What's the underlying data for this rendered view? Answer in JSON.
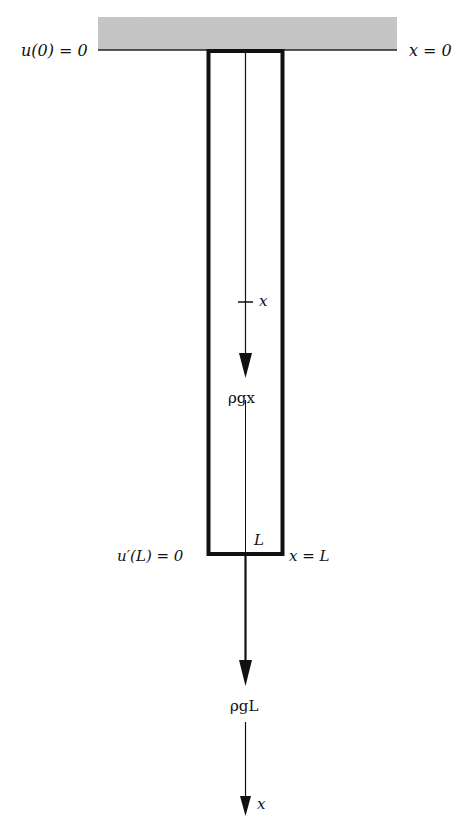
{
  "diagram": {
    "type": "hanging-bar-under-self-weight",
    "colors": {
      "support_fill": "#bdbdbd",
      "line": "#111111",
      "background": "#ffffff"
    },
    "labels": {
      "boundary_top_left": "u(0) = 0",
      "boundary_top_right": "x = 0",
      "internal_position": "x",
      "internal_force": "ρgx",
      "bar_length": "L",
      "boundary_bottom_left": "u′(L) = 0",
      "boundary_bottom_right": "x = L",
      "end_force": "ρgL",
      "axis_label": "x"
    }
  }
}
